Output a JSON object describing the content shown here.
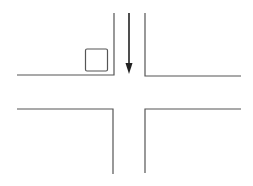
{
  "diagram": {
    "type": "intersection",
    "colors": {
      "line": "#555555",
      "arrow": "#222222",
      "background": "#ffffff"
    },
    "elements": {
      "road_top_left_corner": "top-left curb",
      "road_top_right_corner": "top-right curb",
      "road_bottom_left_corner": "bottom-left curb",
      "road_bottom_right_corner": "bottom-right curb",
      "box": "square marker",
      "arrow": "southbound direction arrow"
    }
  }
}
